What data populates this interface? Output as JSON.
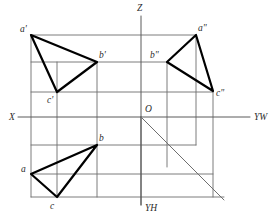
{
  "figure": {
    "title_visible": false,
    "canvas": {
      "width": 278,
      "height": 222
    },
    "colors": {
      "background": "#ffffff",
      "triangle_stroke": "#000000",
      "construction_stroke": "#6e6e6e",
      "axis_stroke": "#5a5a5a",
      "mitre_stroke": "#6e6e6e",
      "label_fill": "#2b2b2b"
    },
    "stroke_widths": {
      "triangle": 2.2,
      "construction": 0.9,
      "axis": 1.0,
      "mitre": 1.0
    }
  },
  "axes": [
    {
      "name": "z-axis",
      "label": "Z",
      "label_x": 137,
      "label_y": 11,
      "x1": 141,
      "y1": 16,
      "x2": 141,
      "y2": 205
    },
    {
      "name": "x-axis",
      "label": "X",
      "label_x": 9,
      "label_y": 120,
      "x1": 18,
      "y1": 117,
      "x2": 141,
      "y2": 117
    },
    {
      "name": "yw-axis",
      "label": "YW",
      "label_x": 254,
      "label_y": 120,
      "x1": 141,
      "y1": 117,
      "x2": 250,
      "y2": 117
    },
    {
      "name": "yh-axis",
      "label": "YH",
      "label_x": 145,
      "label_y": 211,
      "x1": 141,
      "y1": 117,
      "x2": 141,
      "y2": 205
    }
  ],
  "origin": {
    "name": "origin",
    "label": "O",
    "label_x": 145,
    "label_y": 112,
    "x": 141,
    "y": 117
  },
  "mitre_line": {
    "name": "forty-five-degree-mitre-line",
    "x1": 141,
    "y1": 117,
    "x2": 224,
    "y2": 200
  },
  "views": [
    {
      "name": "front-view",
      "id": "v-front",
      "vertices": [
        {
          "label": "a'",
          "x": 31,
          "y": 35,
          "label_x": 20,
          "label_y": 32
        },
        {
          "label": "b'",
          "x": 97,
          "y": 62,
          "label_x": 99,
          "label_y": 58
        },
        {
          "label": "c'",
          "x": 57,
          "y": 92,
          "label_x": 47,
          "label_y": 103
        }
      ]
    },
    {
      "name": "side-view",
      "id": "v-side",
      "vertices": [
        {
          "label": "a\"",
          "x": 196,
          "y": 35,
          "label_x": 198,
          "label_y": 31
        },
        {
          "label": "b\"",
          "x": 167,
          "y": 62,
          "label_x": 150,
          "label_y": 58
        },
        {
          "label": "c\"",
          "x": 213,
          "y": 91,
          "label_x": 216,
          "label_y": 96
        }
      ]
    },
    {
      "name": "top-view",
      "id": "v-top",
      "vertices": [
        {
          "label": "a",
          "x": 31,
          "y": 174,
          "label_x": 21,
          "label_y": 172
        },
        {
          "label": "b",
          "x": 97,
          "y": 145,
          "label_x": 99,
          "label_y": 141
        },
        {
          "label": "c",
          "x": 57,
          "y": 197,
          "label_x": 50,
          "label_y": 209
        }
      ]
    }
  ],
  "construction_lines": {
    "horizontal": [
      {
        "name": "projector-a-horizontal",
        "x1": 31,
        "y1": 35,
        "x2": 196,
        "y2": 35
      },
      {
        "name": "projector-b-horizontal",
        "x1": 31,
        "y1": 62,
        "x2": 167,
        "y2": 62
      },
      {
        "name": "projector-c-horizontal",
        "x1": 31,
        "y1": 92,
        "x2": 213,
        "y2": 92
      },
      {
        "name": "projector-b-top-horizontal",
        "x1": 31,
        "y1": 145,
        "x2": 196,
        "y2": 145
      },
      {
        "name": "projector-a-top-horizontal",
        "x1": 31,
        "y1": 174,
        "x2": 213,
        "y2": 174
      },
      {
        "name": "projector-c-top-horizontal",
        "x1": 31,
        "y1": 197,
        "x2": 224,
        "y2": 197
      }
    ],
    "vertical": [
      {
        "name": "projector-a-vertical",
        "x1": 31,
        "y1": 35,
        "x2": 31,
        "y2": 197
      },
      {
        "name": "projector-c-vertical",
        "x1": 57,
        "y1": 62,
        "x2": 57,
        "y2": 197
      },
      {
        "name": "projector-b-vertical",
        "x1": 97,
        "y1": 62,
        "x2": 97,
        "y2": 197
      },
      {
        "name": "projector-bside-vertical",
        "x1": 167,
        "y1": 62,
        "x2": 167,
        "y2": 167
      },
      {
        "name": "projector-aside-vertical",
        "x1": 196,
        "y1": 35,
        "x2": 196,
        "y2": 145
      },
      {
        "name": "projector-cside-vertical",
        "x1": 213,
        "y1": 91,
        "x2": 213,
        "y2": 197
      }
    ]
  }
}
